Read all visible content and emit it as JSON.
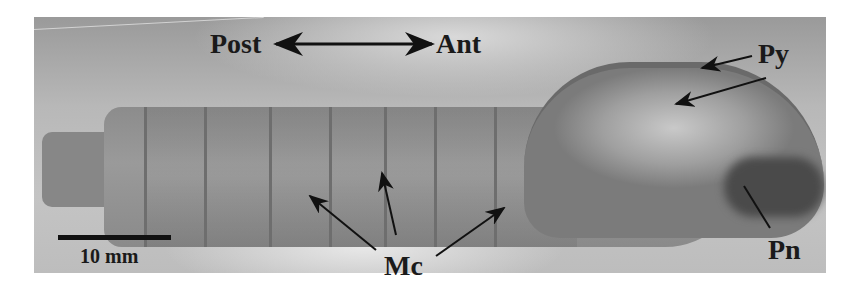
{
  "figure": {
    "orientation": {
      "left_label": "Post",
      "right_label": "Ant",
      "arrow": "double-headed-arrow"
    },
    "annotations": [
      {
        "id": "py",
        "label": "Py",
        "arrow_count": 2
      },
      {
        "id": "mc",
        "label": "Mc",
        "arrow_count": 3
      },
      {
        "id": "pn",
        "label": "Pn",
        "arrow_count": 1
      }
    ],
    "scale_bar": {
      "label": "10 mm",
      "color": "#111111"
    },
    "colors": {
      "background": "#ffffff",
      "photo_gray": "#b0b0b0",
      "label_text": "#1a1a1a"
    }
  }
}
